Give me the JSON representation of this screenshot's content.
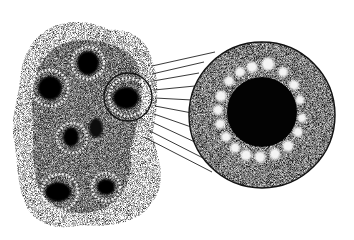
{
  "figure": {
    "style": "stippled black-and-white illustration",
    "background": "#ffffff",
    "ink": "#111111",
    "tissue": {
      "description": "irregular stippled tissue mass containing several cells with dark nuclei",
      "cells": [
        {
          "cx": 88,
          "cy": 63,
          "r": 16
        },
        {
          "cx": 50,
          "cy": 88,
          "r": 18
        },
        {
          "cx": 128,
          "cy": 97,
          "r": 22,
          "highlighted": true
        },
        {
          "cx": 72,
          "cy": 138,
          "r": 14
        },
        {
          "cx": 95,
          "cy": 130,
          "r": 10
        },
        {
          "cx": 60,
          "cy": 192,
          "r": 18
        },
        {
          "cx": 106,
          "cy": 187,
          "r": 14
        }
      ]
    },
    "callout": {
      "description": "magnified circular view of highlighted cell showing dark nucleus ringed by light granules",
      "cx": 262,
      "cy": 115,
      "r": 73,
      "nucleus_r": 34,
      "granule_count": 18,
      "connector_line_count": 10
    }
  }
}
